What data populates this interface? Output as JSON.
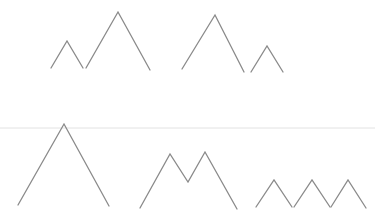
{
  "scene": {
    "description": "Line drawings of mountain peak shapes in two rows separated by a faint horizontal divider",
    "stroke_color": "#8a8a8a",
    "divider_color": "#e2e2e2",
    "background_color": "#ffffff",
    "rows": [
      {
        "name": "top-row",
        "groups": [
          {
            "name": "double-peak-left",
            "peak_count": 2
          },
          {
            "name": "double-peak-right",
            "peak_count": 2
          }
        ]
      },
      {
        "name": "bottom-row",
        "groups": [
          {
            "name": "single-large-peak",
            "peak_count": 1
          },
          {
            "name": "m-shape-peaks",
            "peak_count": 2
          },
          {
            "name": "triple-small-peaks",
            "peak_count": 3
          }
        ]
      }
    ]
  }
}
